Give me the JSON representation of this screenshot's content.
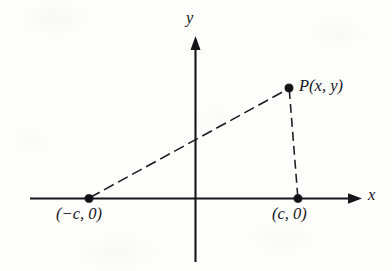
{
  "figure": {
    "kind": "coordinate-plane-diagram",
    "background_color": "#fdfdfc",
    "ink_color": "#15151a"
  },
  "axes": {
    "x_label": "x",
    "y_label": "y",
    "x_axis": {
      "start_x": 30,
      "end_x": 362,
      "y": 198.5,
      "arrow": "right"
    },
    "y_axis": {
      "x": 195.5,
      "top_y": 37,
      "bottom_y": 262,
      "arrow": "up"
    },
    "origin": {
      "x": 195.5,
      "y": 198.5
    }
  },
  "points": [
    {
      "name": "point-left-focus",
      "label": "(−c, 0)",
      "x": 89,
      "y": 198.5,
      "label_x": 56,
      "label_y": 206
    },
    {
      "name": "point-right-focus",
      "label": "(c, 0)",
      "x": 298,
      "y": 198.5,
      "label_x": 272,
      "label_y": 206
    },
    {
      "name": "point-p",
      "label": "P(x, y)",
      "x": 289,
      "y": 88,
      "label_x": 299,
      "label_y": 78
    }
  ],
  "segments": [
    {
      "name": "segment-left-focus-to-p",
      "style": "dashed",
      "from": {
        "x": 89,
        "y": 198.5
      },
      "to": {
        "x": 289,
        "y": 88
      },
      "dash_pattern": "11 5"
    },
    {
      "name": "segment-p-to-right-focus",
      "style": "dashed",
      "from": {
        "x": 289,
        "y": 88
      },
      "to": {
        "x": 298,
        "y": 198
      },
      "dash_pattern": "9 5"
    }
  ]
}
